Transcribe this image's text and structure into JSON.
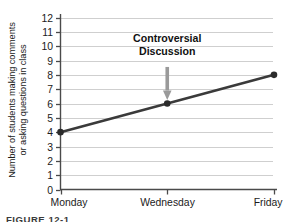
{
  "figure": {
    "caption": "FIGURE 12-1"
  },
  "chart_data": {
    "type": "line",
    "title": "",
    "xlabel": "",
    "ylabel": "Number of students making comments or asking questions in class",
    "ylabel_line1": "Number of students making comments",
    "ylabel_line2": "or asking questions in class",
    "categories": [
      "Monday",
      "Wednesday",
      "Friday"
    ],
    "values": [
      4,
      6,
      8
    ],
    "series": [
      {
        "name": "Students participating",
        "values": [
          4,
          6,
          8
        ]
      }
    ],
    "ylim": [
      0,
      12
    ],
    "ytick_labels": [
      "0",
      "1",
      "2",
      "3",
      "4",
      "5",
      "6",
      "7",
      "8",
      "9",
      "10",
      "11",
      "12"
    ],
    "ytick_values": [
      0,
      1,
      2,
      3,
      4,
      5,
      6,
      7,
      8,
      9,
      10,
      11,
      12
    ],
    "grid": true,
    "grid_axis": "y",
    "legend": false,
    "legend_position": "none",
    "line_color": "#3a3a3a",
    "marker_color": "#2b2b2b",
    "grid_color": "#cfcfcf",
    "axis_color": "#4a4a4a",
    "annotations": [
      {
        "text_line1": "Controversial",
        "text_line2": "Discussion",
        "target_category": "Wednesday",
        "target_value": 6,
        "arrow_color": "#9a9a9a"
      }
    ]
  }
}
